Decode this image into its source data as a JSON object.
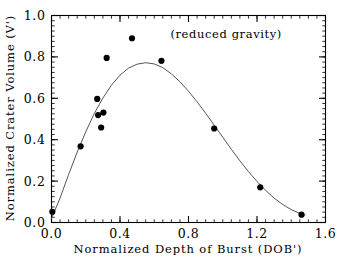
{
  "chart_data": {
    "type": "scatter",
    "title": "",
    "xlabel": "Normalized Depth of Burst (DOB')",
    "ylabel": "Normalized Crater Volume (V')",
    "xlim": [
      0.0,
      1.6
    ],
    "ylim": [
      0.0,
      1.0
    ],
    "grid": false,
    "legend": "none",
    "annotations": [
      {
        "text": "(reduced gravity)",
        "x": 1.02,
        "y": 0.89
      }
    ],
    "xticks": [
      "0.0",
      "0.4",
      "0.8",
      "1.2",
      "1.6"
    ],
    "xtick_values": [
      0.0,
      0.4,
      0.8,
      1.2,
      1.6
    ],
    "yticks": [
      "0.0",
      "0.2",
      "0.4",
      "0.6",
      "0.8",
      "1.0"
    ],
    "ytick_values": [
      0.0,
      0.2,
      0.4,
      0.6,
      0.8,
      1.0
    ],
    "x_minor_tick_interval": 0.05,
    "y_minor_tick_interval": 0.025,
    "series": [
      {
        "name": "measured craters",
        "type": "scatter",
        "marker": "filled-circle",
        "color": "#000000",
        "points": [
          {
            "x": 0.005,
            "y": 0.052
          },
          {
            "x": 0.17,
            "y": 0.368
          },
          {
            "x": 0.267,
            "y": 0.597
          },
          {
            "x": 0.272,
            "y": 0.519
          },
          {
            "x": 0.303,
            "y": 0.531
          },
          {
            "x": 0.29,
            "y": 0.459
          },
          {
            "x": 0.322,
            "y": 0.795
          },
          {
            "x": 0.47,
            "y": 0.89
          },
          {
            "x": 0.642,
            "y": 0.781
          },
          {
            "x": 0.95,
            "y": 0.454
          },
          {
            "x": 1.219,
            "y": 0.17
          },
          {
            "x": 1.46,
            "y": 0.038
          }
        ]
      },
      {
        "name": "fitted curve",
        "type": "line",
        "color": "#555555",
        "points": [
          {
            "x": 0.0,
            "y": 0.02
          },
          {
            "x": 0.05,
            "y": 0.118
          },
          {
            "x": 0.1,
            "y": 0.232
          },
          {
            "x": 0.15,
            "y": 0.34
          },
          {
            "x": 0.2,
            "y": 0.438
          },
          {
            "x": 0.25,
            "y": 0.527
          },
          {
            "x": 0.3,
            "y": 0.601
          },
          {
            "x": 0.35,
            "y": 0.663
          },
          {
            "x": 0.4,
            "y": 0.712
          },
          {
            "x": 0.45,
            "y": 0.746
          },
          {
            "x": 0.5,
            "y": 0.765
          },
          {
            "x": 0.55,
            "y": 0.772
          },
          {
            "x": 0.6,
            "y": 0.766
          },
          {
            "x": 0.65,
            "y": 0.748
          },
          {
            "x": 0.7,
            "y": 0.718
          },
          {
            "x": 0.75,
            "y": 0.68
          },
          {
            "x": 0.8,
            "y": 0.634
          },
          {
            "x": 0.85,
            "y": 0.583
          },
          {
            "x": 0.9,
            "y": 0.528
          },
          {
            "x": 0.95,
            "y": 0.47
          },
          {
            "x": 1.0,
            "y": 0.412
          },
          {
            "x": 1.05,
            "y": 0.354
          },
          {
            "x": 1.1,
            "y": 0.298
          },
          {
            "x": 1.15,
            "y": 0.246
          },
          {
            "x": 1.2,
            "y": 0.198
          },
          {
            "x": 1.25,
            "y": 0.155
          },
          {
            "x": 1.3,
            "y": 0.118
          },
          {
            "x": 1.35,
            "y": 0.087
          },
          {
            "x": 1.4,
            "y": 0.062
          },
          {
            "x": 1.45,
            "y": 0.044
          },
          {
            "x": 1.48,
            "y": 0.036
          }
        ]
      }
    ]
  }
}
